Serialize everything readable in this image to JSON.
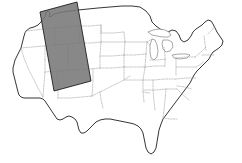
{
  "figure": {
    "name": "us-map-with-swath",
    "background_color": "#ffffff",
    "width": 242,
    "height": 163
  },
  "basemap": {
    "region_label": "Continental United States",
    "outline_color": "#2b2b2b",
    "state_border_color": "#9a9a9a",
    "state_border_style": "dotted",
    "land_fill": "#ffffff",
    "lake_outline_color": "#6f6f6f",
    "lakes_label": "Great Lakes"
  },
  "overlay": {
    "label": "coverage-swath",
    "shape": "parallelogram",
    "fill_color": "#787878",
    "stroke_color": "#1e1e1e",
    "opacity": "0.88",
    "orientation": "north-northeast tilted band",
    "region_covered": "Pacific Northwest to Intermountain West",
    "corners": [
      {
        "name": "top-left",
        "x": 40,
        "y": 12
      },
      {
        "name": "top-right",
        "x": 77,
        "y": 2
      },
      {
        "name": "bottom-right",
        "x": 91,
        "y": 81
      },
      {
        "name": "bottom-left",
        "x": 54,
        "y": 91
      }
    ]
  }
}
